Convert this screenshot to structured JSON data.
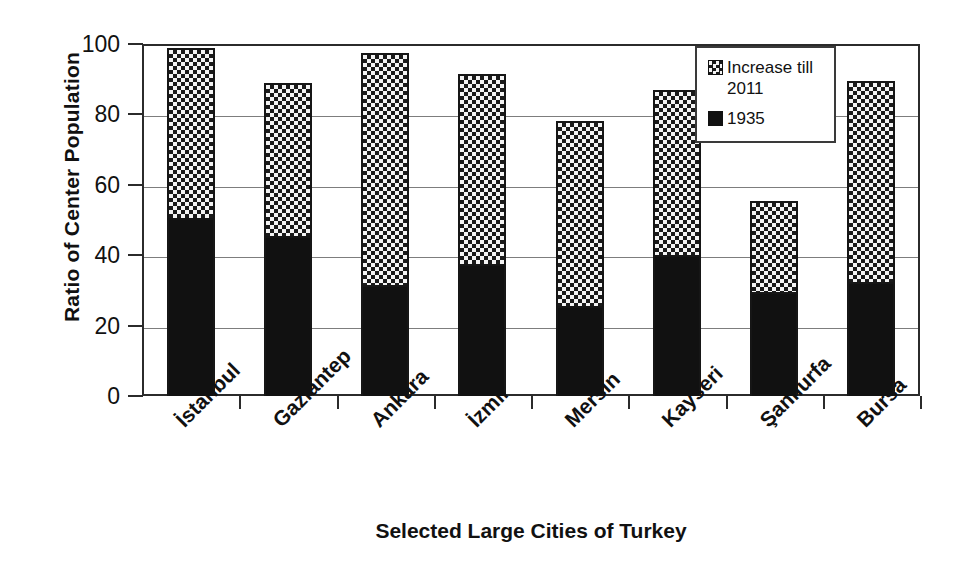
{
  "chart_data": {
    "type": "bar",
    "subtype": "stacked-vertical",
    "title": "",
    "xlabel": "Selected Large Cities of Turkey",
    "ylabel": "Ratio of Center Population",
    "ylim": [
      0,
      100
    ],
    "yticks": [
      0,
      20,
      40,
      60,
      80,
      100
    ],
    "grid": true,
    "grid_axis": "y",
    "legend_position": "top-right",
    "categories": [
      "İstanbul",
      "Gaziantep",
      "Ankara",
      "İzmir",
      "Mersin",
      "Kayseri",
      "Şanlıurfa",
      "Bursa"
    ],
    "series": [
      {
        "name": "1935",
        "pattern": "solid-black",
        "color": "#111111",
        "values": [
          50.5,
          45.5,
          31.5,
          37.5,
          25.5,
          40.0,
          29.5,
          32.5
        ]
      },
      {
        "name": "Increase till 2011",
        "pattern": "checkerboard",
        "color": "#f2f2f2",
        "values": [
          48.5,
          43.5,
          66.0,
          54.0,
          52.5,
          47.0,
          26.0,
          57.0
        ]
      }
    ],
    "totals": [
      99.0,
      89.0,
      97.5,
      91.5,
      78.0,
      87.0,
      55.5,
      89.5
    ]
  },
  "legend": {
    "entries": [
      {
        "label": "Increase till 2011",
        "swatch": "checkerboard-swatch"
      },
      {
        "label": "1935",
        "swatch": "solid-black-swatch"
      }
    ]
  },
  "axes": {
    "y_title": "Ratio of Center Population",
    "x_title": "Selected Large Cities of Turkey",
    "y_tick_labels": [
      "100",
      "80",
      "60",
      "40",
      "20",
      "0"
    ]
  }
}
